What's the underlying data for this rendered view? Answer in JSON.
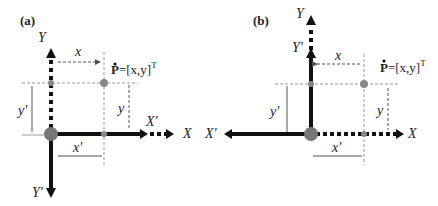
{
  "panels": [
    {
      "label": "(a)",
      "axes": {
        "X": "X",
        "Y": "Y",
        "Xp": "X'",
        "Yp": "Y'"
      },
      "dims": {
        "x": "x",
        "y": "y",
        "xp": "x'",
        "yp": "y'"
      },
      "point": {
        "name": "P",
        "formula": "=[x,y]",
        "sup": "T"
      }
    },
    {
      "label": "(b)",
      "axes": {
        "X": "X",
        "Y": "Y",
        "Xp": "X'",
        "Yp": "Y'"
      },
      "dims": {
        "x": "x",
        "y": "y",
        "xp": "x'",
        "yp": "y'"
      },
      "point": {
        "name": "P",
        "formula": "=[x,y]",
        "sup": "T"
      }
    }
  ],
  "colors": {
    "axis": "#111111",
    "dot": "#777777",
    "guide": "#888888"
  }
}
